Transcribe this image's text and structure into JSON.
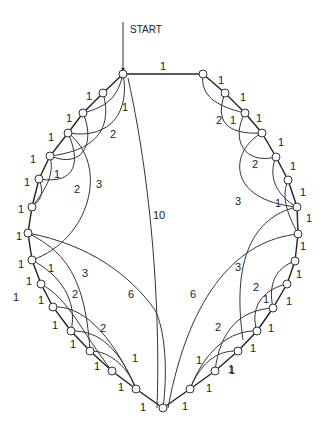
{
  "diagram": {
    "start_label": "START",
    "top_edge_weight": "1",
    "center_edge_weight": "10",
    "left_long_weight": "6",
    "right_long_weight": "6",
    "left_labels": [
      {
        "x": 86,
        "y": 100,
        "t": "1"
      },
      {
        "x": 66,
        "y": 122,
        "t": "1"
      },
      {
        "x": 48,
        "y": 141,
        "t": "1"
      },
      {
        "x": 30,
        "y": 163,
        "t": "1"
      },
      {
        "x": 24,
        "y": 186,
        "t": "1"
      },
      {
        "x": 18,
        "y": 213,
        "t": "1"
      },
      {
        "x": 16,
        "y": 240,
        "t": "1"
      },
      {
        "x": 18,
        "y": 268,
        "t": "1"
      },
      {
        "x": 26,
        "y": 285,
        "t": "1"
      },
      {
        "x": 38,
        "y": 304,
        "t": "1"
      },
      {
        "x": 52,
        "y": 329,
        "t": "1"
      },
      {
        "x": 70,
        "y": 348,
        "t": "1"
      },
      {
        "x": 94,
        "y": 370,
        "t": "1"
      },
      {
        "x": 118,
        "y": 391,
        "t": "1"
      },
      {
        "x": 140,
        "y": 411,
        "t": "1"
      },
      {
        "x": 122,
        "y": 111,
        "t": "1"
      },
      {
        "x": 110,
        "y": 138,
        "t": "2"
      },
      {
        "x": 54,
        "y": 178,
        "t": "1"
      },
      {
        "x": 74,
        "y": 193,
        "t": "2"
      },
      {
        "x": 96,
        "y": 188,
        "t": "3"
      },
      {
        "x": 48,
        "y": 272,
        "t": "1"
      },
      {
        "x": 82,
        "y": 277,
        "t": "3"
      },
      {
        "x": 72,
        "y": 298,
        "t": "2"
      },
      {
        "x": 100,
        "y": 332,
        "t": "2"
      },
      {
        "x": 132,
        "y": 362,
        "t": "1"
      },
      {
        "x": 13,
        "y": 301,
        "t": "1"
      }
    ],
    "right_labels": [
      {
        "x": 218,
        "y": 84,
        "t": "1"
      },
      {
        "x": 240,
        "y": 101,
        "t": "1"
      },
      {
        "x": 256,
        "y": 122,
        "t": "1"
      },
      {
        "x": 278,
        "y": 146,
        "t": "1"
      },
      {
        "x": 290,
        "y": 170,
        "t": "1"
      },
      {
        "x": 300,
        "y": 196,
        "t": "1"
      },
      {
        "x": 306,
        "y": 222,
        "t": "1"
      },
      {
        "x": 300,
        "y": 250,
        "t": "1"
      },
      {
        "x": 296,
        "y": 278,
        "t": "1"
      },
      {
        "x": 286,
        "y": 305,
        "t": "1"
      },
      {
        "x": 268,
        "y": 332,
        "t": "1"
      },
      {
        "x": 250,
        "y": 352,
        "t": "1"
      },
      {
        "x": 228,
        "y": 373,
        "t": "1"
      },
      {
        "x": 206,
        "y": 392,
        "t": "1"
      },
      {
        "x": 182,
        "y": 410,
        "t": "1"
      },
      {
        "x": 216,
        "y": 124,
        "t": "2"
      },
      {
        "x": 230,
        "y": 124,
        "t": "1"
      },
      {
        "x": 252,
        "y": 168,
        "t": "2"
      },
      {
        "x": 235,
        "y": 205,
        "t": "3"
      },
      {
        "x": 275,
        "y": 207,
        "t": "1"
      },
      {
        "x": 235,
        "y": 271,
        "t": "3"
      },
      {
        "x": 253,
        "y": 291,
        "t": "2"
      },
      {
        "x": 263,
        "y": 303,
        "t": "1"
      },
      {
        "x": 215,
        "y": 331,
        "t": "2"
      },
      {
        "x": 196,
        "y": 364,
        "t": "1"
      },
      {
        "x": 229,
        "y": 374,
        "t": "1"
      }
    ]
  }
}
